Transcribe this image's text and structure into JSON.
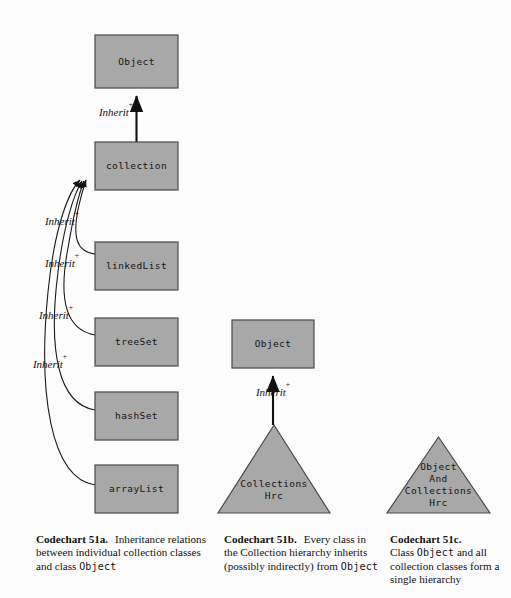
{
  "figure": {
    "background_color": "#fdfdfd",
    "node_fill_color": "#a8a8a8",
    "node_stroke_color": "#4a4a4a",
    "edge_color": "#1b1b1b"
  },
  "chart_a": {
    "id": "codechart-51a",
    "nodes": [
      {
        "key": "object",
        "label": "Object",
        "shape": "box",
        "x": 95,
        "y": 35,
        "w": 83,
        "h": 53
      },
      {
        "key": "collection",
        "label": "collection",
        "shape": "box",
        "x": 95,
        "y": 142,
        "w": 83,
        "h": 48
      },
      {
        "key": "linkedList",
        "label": "linkedList",
        "shape": "box",
        "x": 95,
        "y": 242,
        "w": 83,
        "h": 48
      },
      {
        "key": "treeSet",
        "label": "treeSet",
        "shape": "box",
        "x": 95,
        "y": 318,
        "w": 83,
        "h": 48
      },
      {
        "key": "hashSet",
        "label": "hashSet",
        "shape": "box",
        "x": 95,
        "y": 392,
        "w": 83,
        "h": 48
      },
      {
        "key": "arrayList",
        "label": "arrayList",
        "shape": "box",
        "x": 95,
        "y": 465,
        "w": 83,
        "h": 48
      }
    ],
    "edges": [
      {
        "from": "collection",
        "to": "object",
        "label": "Inherit",
        "sup": "+",
        "label_x": 116,
        "label_y": 113
      },
      {
        "from": "linkedList",
        "to": "collection",
        "label": "Inherit",
        "sup": "+",
        "label_x": 62,
        "label_y": 222
      },
      {
        "from": "treeSet",
        "to": "collection",
        "label": "Inherit",
        "sup": "+",
        "label_x": 62,
        "label_y": 264
      },
      {
        "from": "hashSet",
        "to": "collection",
        "label": "Inherit",
        "sup": "+",
        "label_x": 56,
        "label_y": 316
      },
      {
        "from": "arrayList",
        "to": "collection",
        "label": "Inherit",
        "sup": "+",
        "label_x": 50,
        "label_y": 365
      }
    ]
  },
  "chart_b": {
    "id": "codechart-51b",
    "nodes": [
      {
        "key": "object",
        "label": "Object",
        "shape": "box",
        "x": 232,
        "y": 320,
        "w": 82,
        "h": 48
      },
      {
        "key": "collections",
        "label": [
          "Collections",
          "Hrc"
        ],
        "shape": "triangle",
        "x": 218,
        "y": 425,
        "w": 112,
        "h": 88
      }
    ],
    "edges": [
      {
        "from": "collections",
        "to": "object",
        "label": "Inherit",
        "sup": "+",
        "label_x": 273,
        "label_y": 393
      }
    ]
  },
  "chart_c": {
    "id": "codechart-51c",
    "nodes": [
      {
        "key": "objectAndCollections",
        "label": [
          "Object",
          "And",
          "Collections",
          "Hrc"
        ],
        "shape": "triangle",
        "x": 387,
        "y": 437,
        "w": 103,
        "h": 76
      }
    ],
    "edges": []
  },
  "captions": {
    "a": {
      "tag": "Codechart 51a.",
      "text_before": "Inheritance relations between individual collection classes and class ",
      "mono": "Object",
      "text_after": ""
    },
    "b": {
      "tag": "Codechart 51b.",
      "text_before": "Every class in the Collection hierarchy inherits (possibly indirectly) from ",
      "mono": "Object",
      "text_after": ""
    },
    "c": {
      "tag": "Codechart 51c.",
      "text_before": "Class ",
      "mono": "Object",
      "text_after": " and all collection classes form a single hierarchy"
    }
  }
}
